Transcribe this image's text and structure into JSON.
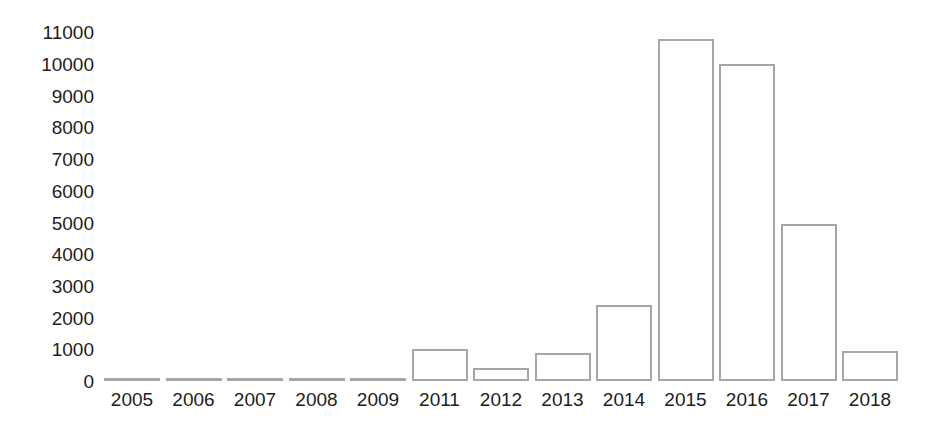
{
  "chart_data": {
    "type": "bar",
    "title": "",
    "subtitle": "",
    "xlabel": "",
    "ylabel": "",
    "categories": [
      "2005",
      "2006",
      "2007",
      "2008",
      "2009",
      "2011",
      "2012",
      "2013",
      "2014",
      "2015",
      "2016",
      "2017",
      "2018"
    ],
    "values": [
      0,
      0,
      0,
      0,
      0,
      1000,
      400,
      870,
      2400,
      10800,
      10000,
      4950,
      960
    ],
    "ylim": [
      0,
      11000
    ],
    "y_ticks": [
      0,
      1000,
      2000,
      3000,
      4000,
      5000,
      6000,
      7000,
      8000,
      9000,
      10000,
      11000
    ],
    "y_tick_labels": [
      "0",
      "1000",
      "2000",
      "3000",
      "4000",
      "5000",
      "6000",
      "7000",
      "8000",
      "9000",
      "10000",
      "11000"
    ],
    "grid": false,
    "legend": null,
    "legend_position": "none",
    "annotations": [],
    "colors": {
      "bar_fill": "#ffffff",
      "bar_outline": "#a6a6a6",
      "text": "#1d1d1b",
      "background": "#ffffff"
    }
  }
}
